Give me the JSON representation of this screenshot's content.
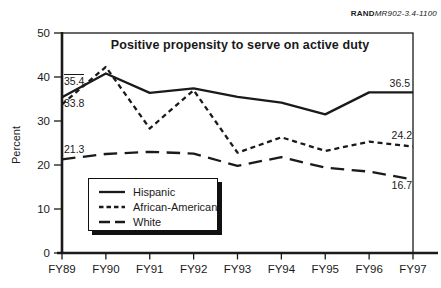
{
  "figure": {
    "source_label": "RAND",
    "source_doc": "MR902-3.4-1100"
  },
  "chart_data": {
    "type": "line",
    "title": "Positive propensity to serve on active duty",
    "xlabel": "",
    "ylabel": "Percent",
    "categories": [
      "FY89",
      "FY90",
      "FY91",
      "FY92",
      "FY93",
      "FY94",
      "FY95",
      "FY96",
      "FY97"
    ],
    "series": [
      {
        "name": "Hispanic",
        "dash": "solid",
        "values": [
          35.4,
          40.8,
          36.4,
          37.4,
          35.5,
          34.2,
          31.5,
          36.5,
          36.5
        ]
      },
      {
        "name": "African-American",
        "dash": "short-dash",
        "values": [
          33.8,
          42.3,
          28.3,
          37.0,
          22.8,
          26.3,
          23.2,
          25.3,
          24.2
        ]
      },
      {
        "name": "White",
        "dash": "long-dash",
        "values": [
          21.3,
          22.5,
          23.0,
          22.6,
          19.8,
          21.8,
          19.4,
          18.5,
          16.7
        ]
      }
    ],
    "ylim": [
      0,
      50
    ],
    "ytick_step": 10,
    "grid": false,
    "legend_position": "lower-left-inside",
    "annotations": [
      {
        "text": "35.4",
        "x": 64,
        "y": 74,
        "align": "left",
        "overline": true
      },
      {
        "text": "33.8",
        "x": 64,
        "y": 98,
        "align": "left",
        "overline": false
      },
      {
        "text": "21.3",
        "x": 64,
        "y": 144,
        "align": "left",
        "overline": false
      },
      {
        "text": "36.5",
        "x": 410,
        "y": 78,
        "align": "right",
        "overline": false
      },
      {
        "text": "24.2",
        "x": 412,
        "y": 130,
        "align": "right",
        "overline": false
      },
      {
        "text": "16.7",
        "x": 412,
        "y": 180,
        "align": "right",
        "overline": false
      }
    ]
  }
}
